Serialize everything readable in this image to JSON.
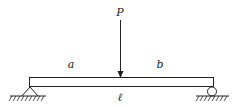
{
  "diagram": {
    "type": "simply-supported-beam",
    "labels": {
      "load": "P",
      "left_segment": "a",
      "right_segment": "b",
      "span": "ℓ"
    },
    "supports": {
      "left": "pin",
      "right": "roller"
    },
    "colors": {
      "stroke": "#222222",
      "background": "#ffffff"
    }
  }
}
